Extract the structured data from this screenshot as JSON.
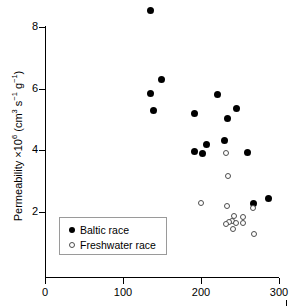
{
  "chart_data": {
    "type": "scatter",
    "title": "",
    "xlabel": "",
    "ylabel": "Permeability ×10⁶ (cm³ s⁻¹ g⁻¹)",
    "ylabel_parts": {
      "prefix": "Permeability ×10",
      "exp1": "6",
      "mid": " (cm",
      "exp2": "3",
      "mid2": " s",
      "exp3": "−1",
      "mid3": " g",
      "exp4": "−1",
      "suffix": ")"
    },
    "xlim": [
      0,
      300
    ],
    "ylim": [
      0,
      8.6
    ],
    "xticks": [
      0,
      100,
      200,
      300
    ],
    "yticks": [
      2,
      4,
      6,
      8
    ],
    "xtick_labels": [
      "0",
      "100",
      "200",
      "300"
    ],
    "ytick_labels": [
      "2",
      "4",
      "6",
      "8"
    ],
    "grid": false,
    "legend_position": "lower-left",
    "series": [
      {
        "name": "Baltic race",
        "marker": "filled-circle",
        "color": "#000000",
        "points": [
          {
            "x": 135,
            "y": 8.55
          },
          {
            "x": 150,
            "y": 6.3
          },
          {
            "x": 136,
            "y": 5.85
          },
          {
            "x": 139,
            "y": 5.28
          },
          {
            "x": 222,
            "y": 5.82
          },
          {
            "x": 246,
            "y": 5.35
          },
          {
            "x": 192,
            "y": 5.18
          },
          {
            "x": 234,
            "y": 5.02
          },
          {
            "x": 230,
            "y": 4.33
          },
          {
            "x": 208,
            "y": 4.18
          },
          {
            "x": 192,
            "y": 3.95
          },
          {
            "x": 260,
            "y": 3.94
          },
          {
            "x": 202,
            "y": 3.88
          },
          {
            "x": 287,
            "y": 2.43
          },
          {
            "x": 268,
            "y": 2.28
          }
        ]
      },
      {
        "name": "Freshwater race",
        "marker": "open-circle",
        "color": "#4d4d4d",
        "points": [
          {
            "x": 233,
            "y": 3.9
          },
          {
            "x": 235,
            "y": 3.17
          },
          {
            "x": 200,
            "y": 2.3
          },
          {
            "x": 234,
            "y": 2.2
          },
          {
            "x": 267,
            "y": 2.12
          },
          {
            "x": 243,
            "y": 1.88
          },
          {
            "x": 255,
            "y": 1.82
          },
          {
            "x": 240,
            "y": 1.72
          },
          {
            "x": 237,
            "y": 1.68
          },
          {
            "x": 246,
            "y": 1.65
          },
          {
            "x": 255,
            "y": 1.63
          },
          {
            "x": 233,
            "y": 1.6
          },
          {
            "x": 241,
            "y": 1.45
          },
          {
            "x": 268,
            "y": 1.27
          }
        ]
      }
    ],
    "legend": [
      {
        "label": "Baltic race",
        "marker": "filled-circle"
      },
      {
        "label": "Freshwater race",
        "marker": "open-circle"
      }
    ]
  }
}
